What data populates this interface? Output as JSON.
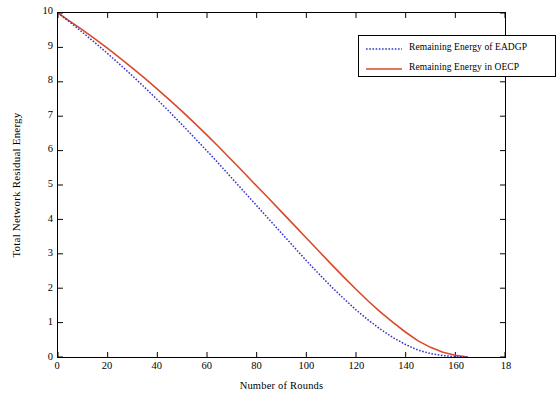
{
  "chart_data": {
    "type": "line",
    "title": "",
    "xlabel": "Number of Rounds",
    "ylabel": "Total Network Residual Energy",
    "xlim": [
      0,
      180
    ],
    "ylim": [
      0,
      10
    ],
    "xticks": [
      0,
      20,
      40,
      60,
      80,
      100,
      120,
      140,
      160,
      180
    ],
    "xticklabels": [
      "0",
      "20",
      "40",
      "60",
      "80",
      "100",
      "120",
      "140",
      "160",
      "18"
    ],
    "yticks": [
      0,
      1,
      2,
      3,
      4,
      5,
      6,
      7,
      8,
      9,
      10
    ],
    "yticklabels": [
      "0",
      "1",
      "2",
      "3",
      "4",
      "5",
      "6",
      "7",
      "8",
      "9",
      "10"
    ],
    "grid": false,
    "legend_position": "top-right",
    "series": [
      {
        "name": "Remaining Energy of EADGP",
        "color": "#3333cc",
        "style": "dotted",
        "x": [
          0,
          5,
          10,
          15,
          20,
          25,
          30,
          35,
          40,
          45,
          50,
          55,
          60,
          65,
          70,
          75,
          80,
          85,
          90,
          95,
          100,
          105,
          110,
          115,
          120,
          125,
          130,
          135,
          140,
          145,
          150,
          155,
          160,
          165
        ],
        "y": [
          10.0,
          9.72,
          9.43,
          9.13,
          8.82,
          8.5,
          8.17,
          7.83,
          7.48,
          7.12,
          6.75,
          6.37,
          5.99,
          5.6,
          5.2,
          4.8,
          4.4,
          4.0,
          3.6,
          3.2,
          2.8,
          2.42,
          2.05,
          1.7,
          1.37,
          1.07,
          0.8,
          0.56,
          0.36,
          0.2,
          0.1,
          0.04,
          0.01,
          0.0
        ]
      },
      {
        "name": "Remaining Energy in OECP",
        "color": "#d94a2b",
        "style": "solid",
        "x": [
          0,
          5,
          10,
          15,
          20,
          25,
          30,
          35,
          40,
          45,
          50,
          55,
          60,
          65,
          70,
          75,
          80,
          85,
          90,
          95,
          100,
          105,
          110,
          115,
          120,
          125,
          130,
          135,
          140,
          145,
          150,
          155,
          160,
          165
        ],
        "y": [
          10.0,
          9.75,
          9.5,
          9.24,
          8.97,
          8.69,
          8.4,
          8.1,
          7.79,
          7.47,
          7.14,
          6.8,
          6.45,
          6.09,
          5.72,
          5.35,
          4.97,
          4.6,
          4.22,
          3.84,
          3.46,
          3.08,
          2.7,
          2.33,
          1.97,
          1.62,
          1.3,
          1.0,
          0.72,
          0.47,
          0.28,
          0.14,
          0.05,
          0.0
        ]
      }
    ]
  },
  "legend": {
    "items": [
      {
        "label": "Remaining Energy of EADGP"
      },
      {
        "label": "Remaining Energy in OECP"
      }
    ]
  }
}
